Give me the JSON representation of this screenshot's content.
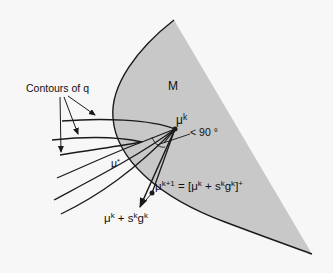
{
  "diagram": {
    "region_label": "M",
    "contours_label": "Contours of q",
    "angle_label": "< 90 °",
    "mu_k": {
      "base": "μ",
      "sup": "k"
    },
    "mu_star": {
      "base": "μ",
      "sup": "*"
    },
    "mu_k1": {
      "base": "μ",
      "sup": "k+1",
      "rest": " = [μ",
      "rest_sup1": "k",
      "rest2": " + s",
      "rest_sup2": "k",
      "rest3": "g",
      "rest_sup3": "k",
      "rest4": "]",
      "rest_sup4": "+"
    },
    "step": {
      "base": "μ",
      "sup1": "k",
      "mid": " + s",
      "sup2": "k",
      "g": "g",
      "sup3": "k"
    },
    "colors": {
      "region_fill": "#c8c8c8",
      "background": "#f7f7f7",
      "stroke": "#1a1a1a"
    }
  }
}
